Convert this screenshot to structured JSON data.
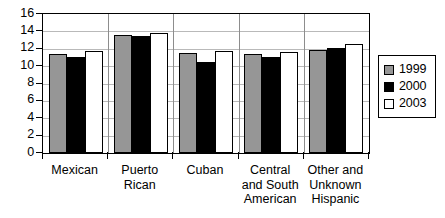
{
  "chart_data": {
    "type": "bar",
    "title": "",
    "xlabel": "",
    "ylabel": "",
    "ylim": [
      0,
      16
    ],
    "yticks": [
      0,
      2,
      4,
      6,
      8,
      10,
      12,
      14,
      16
    ],
    "ytick_labels": [
      "0",
      "2",
      "4",
      "6",
      "8",
      "10",
      "12",
      "14",
      "16"
    ],
    "grid": true,
    "legend_position": "right",
    "categories": [
      "Mexican",
      "Puerto Rican",
      "Cuban",
      "Central and South American",
      "Other and Unknown Hispanic"
    ],
    "category_lines": [
      [
        "Mexican"
      ],
      [
        "Puerto",
        "Rican"
      ],
      [
        "Cuban"
      ],
      [
        "Central",
        "and South",
        "American"
      ],
      [
        "Other and",
        "Unknown",
        "Hispanic"
      ]
    ],
    "series": [
      {
        "name": "1999",
        "color": "#969696",
        "values": [
          11.4,
          13.6,
          11.5,
          11.4,
          11.9
        ]
      },
      {
        "name": "2000",
        "color": "#000000",
        "values": [
          11.0,
          13.5,
          10.5,
          11.0,
          12.1
        ]
      },
      {
        "name": "2003",
        "color": "#ffffff",
        "values": [
          11.7,
          13.8,
          11.8,
          11.6,
          12.5
        ]
      }
    ]
  },
  "legend": {
    "items": [
      {
        "label": "1999",
        "swatch": "#969696"
      },
      {
        "label": "2000",
        "swatch": "#000000"
      },
      {
        "label": "2003",
        "swatch": "#ffffff"
      }
    ]
  }
}
